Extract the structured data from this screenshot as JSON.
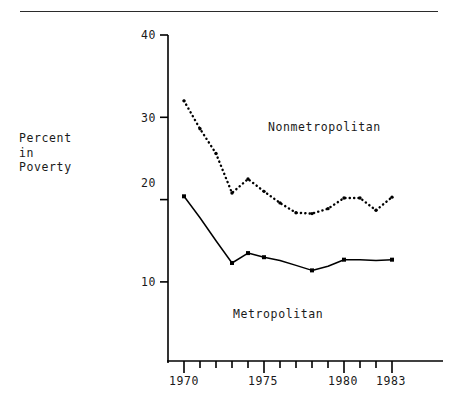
{
  "figure": {
    "ylabel_lines": [
      "Percent",
      "in",
      "Poverty"
    ],
    "ylabel_text": "Percent\nin\nPoverty",
    "rule_color": "#2b2b2b",
    "ink_color": "#000000",
    "background": "#ffffff"
  },
  "chart_data": {
    "type": "line",
    "title": "",
    "xlabel": "",
    "ylabel": "Percent in Poverty",
    "xlim": [
      1969.3,
      1983.9
    ],
    "ylim": [
      0,
      40
    ],
    "yticks": [
      10,
      20,
      30,
      40
    ],
    "ytick_labels": [
      "10",
      "20",
      "30",
      "40"
    ],
    "xticks": [
      1970,
      1971,
      1972,
      1973,
      1974,
      1975,
      1976,
      1977,
      1978,
      1979,
      1980,
      1981,
      1982,
      1983
    ],
    "xtick_labels_major": [
      "1970",
      "1975",
      "1980",
      "1983"
    ],
    "xticks_major": [
      1970,
      1975,
      1980,
      1983
    ],
    "grid": false,
    "legend": "inline-annotation",
    "x": [
      1970,
      1971,
      1972,
      1973,
      1974,
      1975,
      1976,
      1977,
      1978,
      1979,
      1980,
      1981,
      1982,
      1983
    ],
    "series": [
      {
        "name": "Nonmetropolitan",
        "style": "dotted",
        "marker": "dot",
        "color": "#000000",
        "label_position": {
          "x": 268,
          "y": 120
        },
        "values": [
          32.0,
          28.6,
          25.6,
          20.8,
          22.5,
          21.0,
          19.6,
          18.4,
          18.3,
          18.9,
          20.2,
          20.2,
          18.7,
          20.3
        ]
      },
      {
        "name": "Metropolitan",
        "style": "solid",
        "marker": "filled-square",
        "color": "#000000",
        "label_position": {
          "x": 233,
          "y": 307
        },
        "values": [
          20.4,
          17.8,
          15.0,
          12.3,
          13.5,
          13.0,
          12.6,
          12.0,
          11.4,
          11.9,
          12.7,
          12.7,
          12.6,
          12.7
        ]
      }
    ]
  },
  "ytick_pixels": [
    {
      "label": "40",
      "top": 28
    },
    {
      "label": "30",
      "top": 111
    },
    {
      "label": "20",
      "top": 176
    },
    {
      "label": "10",
      "top": 275
    }
  ],
  "xtick_pixels": [
    {
      "label": "1970",
      "left": 161
    },
    {
      "label": "1975",
      "left": 240
    },
    {
      "label": "1980",
      "left": 320
    },
    {
      "label": "1983",
      "left": 368
    }
  ]
}
